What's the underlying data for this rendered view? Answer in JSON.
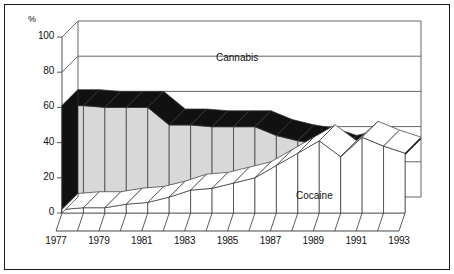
{
  "figure": {
    "border_color": "#1a1a1a",
    "background": "#ffffff"
  },
  "axis": {
    "y_unit_label": "%",
    "y_ticks": [
      0,
      20,
      40,
      60,
      80,
      100
    ],
    "x_tick_labels": [
      "1977",
      "1979",
      "1981",
      "1983",
      "1985",
      "1987",
      "1989",
      "1991",
      "1993"
    ]
  },
  "series_labels": {
    "cannabis": "Cannabis",
    "cocaine": "Cocaine"
  },
  "colors": {
    "cannabis_top": "#111111",
    "cannabis_front": "#d8d8d8",
    "cannabis_side": "#111111",
    "cocaine_top": "#ffffff",
    "cocaine_front": "#ffffff",
    "outline": "#333333",
    "gridline": "#555555",
    "text": "#111111"
  },
  "chart_data": {
    "type": "area",
    "title": "",
    "subtitle": "",
    "xlabel": "",
    "ylabel": "%",
    "ylim": [
      0,
      100
    ],
    "grid": true,
    "legend": "inline-annotations",
    "x": [
      1977,
      1978,
      1979,
      1980,
      1981,
      1982,
      1983,
      1984,
      1985,
      1986,
      1987,
      1988,
      1989,
      1990,
      1991,
      1992,
      1993
    ],
    "categories": [
      "1977",
      "1978",
      "1979",
      "1980",
      "1981",
      "1982",
      "1983",
      "1984",
      "1985",
      "1986",
      "1987",
      "1988",
      "1989",
      "1990",
      "1991",
      "1992",
      "1993"
    ],
    "series": [
      {
        "name": "Cannabis",
        "values": [
          61,
          61,
          60,
          60,
          60,
          50,
          50,
          49,
          49,
          49,
          44,
          41,
          39,
          35,
          38,
          37,
          33
        ]
      },
      {
        "name": "Cocaine",
        "values": [
          2,
          3,
          3,
          5,
          6,
          9,
          13,
          14,
          17,
          20,
          27,
          34,
          41,
          32,
          43,
          38,
          34
        ]
      }
    ]
  }
}
